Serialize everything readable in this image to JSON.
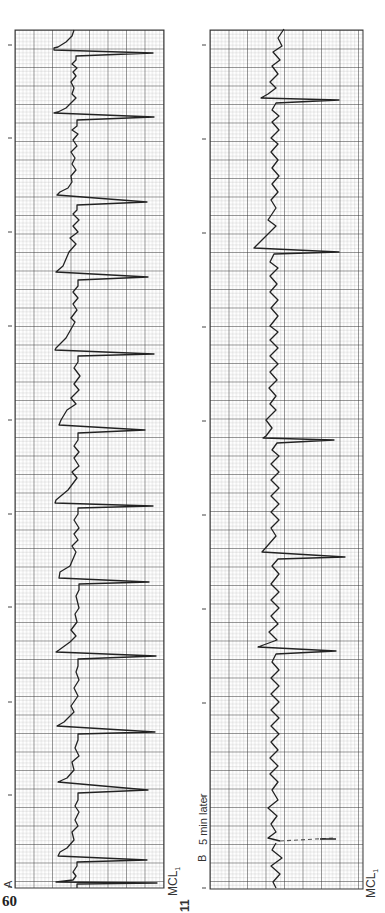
{
  "page": {
    "page_number": "60",
    "figure_number": "11",
    "orientation": "rotated -90deg (text reads bottom-to-top)"
  },
  "strips": [
    {
      "id": "A",
      "label": "A",
      "lead": "MCL",
      "lead_subscript": "1",
      "note": "",
      "rhythm_marks_count": 10,
      "qrs_count": 12
    },
    {
      "id": "B",
      "label": "B",
      "lead": "MCL",
      "lead_subscript": "1",
      "note": "5 min later",
      "rhythm_marks_count": 10,
      "qrs_count": 9
    }
  ],
  "colors": {
    "paper": "#ffffff",
    "grid_minor": "#9a9a9a",
    "grid_major": "#3a3a3a",
    "trace": "#222222"
  }
}
